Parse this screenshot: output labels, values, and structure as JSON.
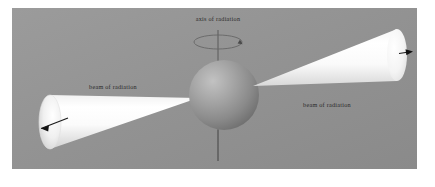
{
  "figure": {
    "name": "pulsar-radiation-beams-diagram",
    "background_color": "#939393",
    "panel": {
      "x": 12,
      "y": 8,
      "width": 405,
      "height": 161
    }
  },
  "labels": {
    "axis": "axis of radiation",
    "beam_left": "beam of radiation",
    "beam_right": "beam of radiation"
  },
  "sphere": {
    "name": "neutron-star-sphere",
    "cx": 224,
    "cy": 95,
    "r": 35,
    "color_light": "#b9b9b9",
    "color_mid": "#8f8f8f",
    "color_dark": "#6a6a6a"
  },
  "axis": {
    "name": "rotation-axis",
    "x": 218,
    "y_top": 30,
    "y_bottom": 161,
    "color": "#5a5a5a",
    "rotation_ellipse": {
      "cx": 218,
      "cy": 42,
      "rx": 24,
      "ry": 7
    }
  },
  "beams": [
    {
      "name": "beam-left",
      "apex": {
        "x": 198,
        "y": 98
      },
      "end_center": {
        "x": 50,
        "y": 122
      },
      "end_rx": 11,
      "end_ry": 27,
      "arrow": {
        "x1": 68,
        "y1": 118,
        "x2": 37,
        "y2": 129
      },
      "label_pos": {
        "x": 113,
        "y": 89
      }
    },
    {
      "name": "beam-right",
      "apex": {
        "x": 253,
        "y": 86
      },
      "end_center": {
        "x": 397,
        "y": 55
      },
      "end_rx": 10,
      "end_ry": 26,
      "arrow": {
        "x1": 399,
        "y1": 54,
        "x2": 412,
        "y2": 52
      },
      "label_pos": {
        "x": 327,
        "y": 105
      }
    }
  ],
  "colors": {
    "beam_white": "#ffffff",
    "beam_shade": "#d6d6d6",
    "arrow": "#1a1a1a",
    "text": "#2a2a2a"
  }
}
